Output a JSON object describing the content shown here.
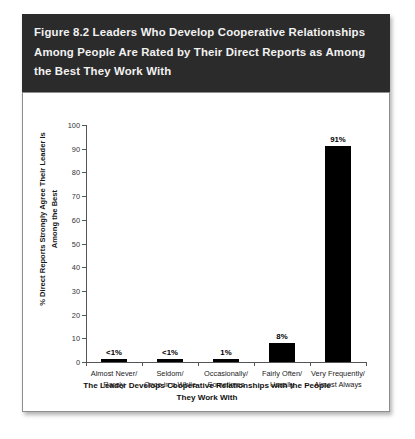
{
  "figure": {
    "title": "Figure 8.2  Leaders Who Develop Cooperative Relationships Among People Are Rated by Their Direct Reports as Among the Best They Work With",
    "title_band_color": "#2b2b2b",
    "title_text_color": "#f2f2f2",
    "bar_color": "#000000",
    "axis_color": "#555555"
  },
  "chart_data": {
    "type": "bar",
    "title": "Figure 8.2  Leaders Who Develop Cooperative Relationships Among People Are Rated by Their Direct Reports as Among the Best They Work With",
    "categories": [
      "Almost Never/ Rarely",
      "Seldom/ Once in a While",
      "Occasionally/ Sometimes",
      "Fairly Often/ Usually",
      "Very Frequently/ Almost Always"
    ],
    "category_lines": [
      [
        "Almost Never/",
        "Rarely"
      ],
      [
        "Seldom/",
        "Once in a While"
      ],
      [
        "Occasionally/",
        "Sometimes"
      ],
      [
        "Fairly Often/",
        "Usually"
      ],
      [
        "Very Frequently/",
        "Almost Always"
      ]
    ],
    "values": [
      0.5,
      0.5,
      1,
      8,
      91
    ],
    "data_labels": [
      "<1%",
      "<1%",
      "1%",
      "8%",
      "91%"
    ],
    "xlabel_lines": [
      "The Leader Develops Cooperative Relationships with the People",
      "They Work With"
    ],
    "ylabel_lines": [
      "% Direct Reports Strongly Agree Their Leader Is",
      "Among the Best"
    ],
    "ylim": [
      0,
      100
    ],
    "yticks": [
      0,
      10,
      20,
      30,
      40,
      50,
      60,
      70,
      80,
      90,
      100
    ],
    "ytick_labels": [
      "0",
      "10",
      "20",
      "30",
      "40",
      "50",
      "60",
      "70",
      "80",
      "90",
      "100"
    ],
    "grid": false,
    "legend": false
  }
}
